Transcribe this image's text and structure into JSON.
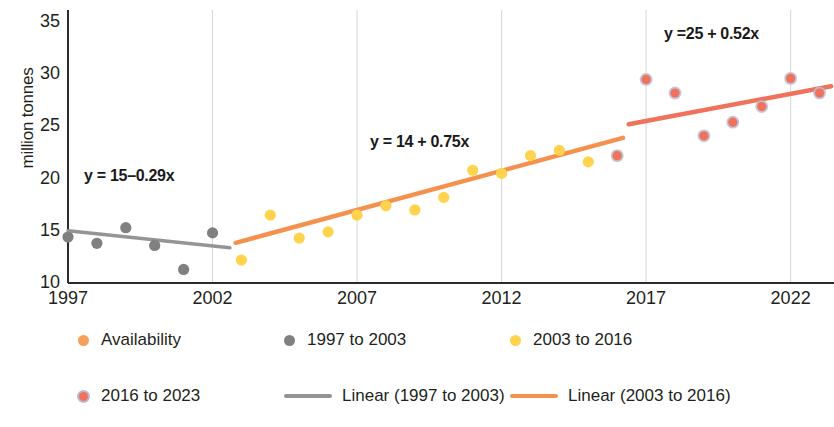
{
  "chart_data": {
    "type": "scatter",
    "title": "",
    "xlabel": "",
    "ylabel": "million tonnes",
    "xlim": [
      1997,
      2023.5
    ],
    "ylim": [
      10,
      35
    ],
    "xticks": [
      1997,
      2002,
      2007,
      2012,
      2017,
      2022
    ],
    "yticks": [
      10,
      15,
      20,
      25,
      30,
      35
    ],
    "grid": "vertical",
    "legend_position": "bottom",
    "series": [
      {
        "name": "1997 to 2003",
        "color": "#808080",
        "x": [
          1997,
          1998,
          1999,
          2000,
          2001,
          2002
        ],
        "values": [
          14.4,
          13.8,
          15.3,
          13.6,
          11.3,
          14.8
        ]
      },
      {
        "name": "2003 to 2016",
        "color": "#ffd34d",
        "x": [
          2003,
          2004,
          2005,
          2006,
          2007,
          2008,
          2009,
          2010,
          2011,
          2012,
          2013,
          2014,
          2015,
          2016
        ],
        "values": [
          12.2,
          16.5,
          14.3,
          14.9,
          16.5,
          17.4,
          17.0,
          18.2,
          20.8,
          20.5,
          22.2,
          22.7,
          21.6,
          22.2
        ]
      },
      {
        "name": "2016 to 2023",
        "color": "#f0715c",
        "x": [
          2016,
          2017,
          2018,
          2019,
          2020,
          2021,
          2022,
          2023
        ],
        "values": [
          22.2,
          29.5,
          28.2,
          24.1,
          25.4,
          26.9,
          29.6,
          28.2
        ]
      }
    ],
    "trendlines": [
      {
        "name": "Linear (1997 to 2003)",
        "color": "#949494",
        "equation": "y = 15–0.29x",
        "intercept": 15,
        "slope": -0.29,
        "x_start": 1997,
        "x_end": 2002.6
      },
      {
        "name": "Linear (2003 to 2016)",
        "color": "#f5914f",
        "equation": "y = 14 + 0.75x",
        "intercept": 14,
        "slope": 0.75,
        "x_start": 2002.8,
        "x_end": 2016.2
      },
      {
        "name": "Linear (2016 to 2023)",
        "color": "#f0715c",
        "equation": "y =25 + 0.52x",
        "intercept": 25,
        "slope": 0.52,
        "x_start": 2016.4,
        "x_end": 2023.4
      }
    ]
  },
  "axis": {
    "ylabel": "million tonnes",
    "yticks": [
      "35",
      "30",
      "25",
      "20",
      "15",
      "10"
    ],
    "xticks": [
      "1997",
      "2002",
      "2007",
      "2012",
      "2017",
      "2022"
    ]
  },
  "annotations": {
    "eq1": "y = 15–0.29x",
    "eq2": "y = 14 + 0.75x",
    "eq3": "y =25 + 0.52x"
  },
  "legend": {
    "items": [
      {
        "label": "Availability",
        "marker": "dot",
        "color": "#f6a05c"
      },
      {
        "label": "1997 to 2003",
        "marker": "dot",
        "color": "#808080"
      },
      {
        "label": "2003 to 2016",
        "marker": "dot",
        "color": "#ffd34d"
      },
      {
        "label": "2016 to 2023",
        "marker": "dot",
        "color": "#f0715c"
      },
      {
        "label": "Linear (1997 to 2003)",
        "marker": "line",
        "color": "#949494"
      },
      {
        "label": "Linear (2003 to 2016)",
        "marker": "line",
        "color": "#f5914f"
      },
      {
        "label": "Linear (2016 to 2023)",
        "marker": "line",
        "color": "#f0715c"
      }
    ]
  }
}
